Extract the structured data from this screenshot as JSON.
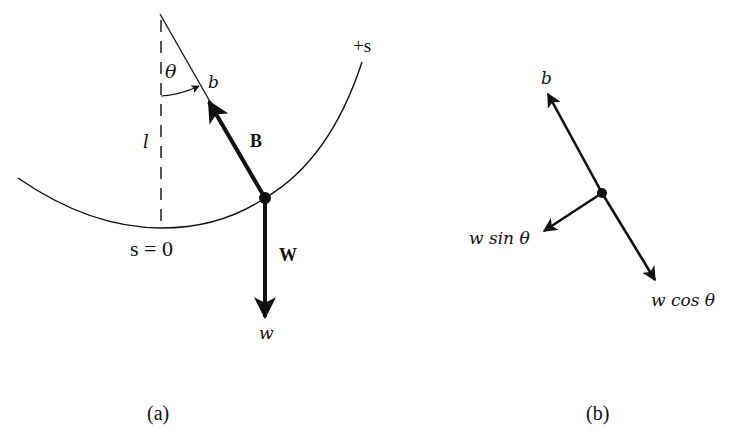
{
  "figure": {
    "panel_a": {
      "caption": "(a)",
      "labels": {
        "theta": "θ",
        "b": "b",
        "plus_s": "+s",
        "l": "l",
        "B": "B",
        "s_zero": "s = 0",
        "W": "W",
        "w": "w"
      }
    },
    "panel_b": {
      "caption": "(b)",
      "labels": {
        "b": "b",
        "w_sin_theta": "w sin θ",
        "w_cos_theta": "w cos θ"
      }
    },
    "colors": {
      "ink": "#111111",
      "background": "#ffffff"
    }
  }
}
